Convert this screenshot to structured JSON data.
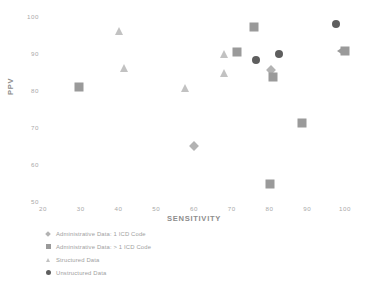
{
  "chart_data": {
    "type": "scatter",
    "title": "",
    "xlabel": "SENSITIVITY",
    "ylabel": "PPV",
    "xlim": [
      20,
      100
    ],
    "ylim": [
      50,
      100
    ],
    "xticks": [
      "20",
      "30",
      "40",
      "50",
      "60",
      "70",
      "80",
      "90",
      "100"
    ],
    "xtick_values": [
      20,
      30,
      40,
      50,
      60,
      70,
      80,
      90,
      100
    ],
    "yticks": [
      "50",
      "60",
      "70",
      "80",
      "90",
      "100"
    ],
    "ytick_values": [
      50,
      60,
      70,
      80,
      90,
      100
    ],
    "grid": false,
    "legend_position": "below-left",
    "colors": {
      "administrative_1_icd": "#b3b3b3",
      "administrative_gt1_icd": "#9a9a9a",
      "structured": "#c2c2c2",
      "unstructured": "#5e5e5e",
      "axis_text": "#a9a9a9",
      "axis_title": "#8d8d8d",
      "legend_text": "#a0a0a0",
      "background": "#ffffff"
    },
    "series": [
      {
        "name": "Administrative Data: 1 ICD Code",
        "marker": "diamond",
        "color": "#b3b3b3",
        "points": [
          {
            "x": 60.0,
            "y": 65.0
          },
          {
            "x": 80.5,
            "y": 85.3
          }
        ]
      },
      {
        "name": "Administrative Data: > 1 ICD Code",
        "marker": "square",
        "color": "#9a9a9a",
        "points": [
          {
            "x": 29.5,
            "y": 80.8
          },
          {
            "x": 71.5,
            "y": 90.3
          },
          {
            "x": 76.0,
            "y": 97.0
          },
          {
            "x": 81.0,
            "y": 83.5
          },
          {
            "x": 88.5,
            "y": 71.0
          },
          {
            "x": 80.0,
            "y": 54.5
          },
          {
            "x": 100.0,
            "y": 90.5
          }
        ]
      },
      {
        "name": "Structured Data",
        "marker": "triangle",
        "color": "#c2c2c2",
        "points": [
          {
            "x": 40.0,
            "y": 96.0
          },
          {
            "x": 41.5,
            "y": 86.0
          },
          {
            "x": 57.5,
            "y": 80.5
          },
          {
            "x": 68.0,
            "y": 89.8
          },
          {
            "x": 68.0,
            "y": 84.5
          }
        ]
      },
      {
        "name": "Unstructured Data",
        "marker": "circle",
        "color": "#5e5e5e",
        "points": [
          {
            "x": 76.5,
            "y": 88.0
          },
          {
            "x": 82.5,
            "y": 89.8
          },
          {
            "x": 97.5,
            "y": 97.8
          }
        ]
      }
    ],
    "annotations": [
      {
        "type": "left-arrow",
        "x": 98.6,
        "y": 90.5,
        "color": "#9a9a9a"
      }
    ]
  },
  "legend": {
    "items": [
      {
        "label": "Administrative Data: 1 ICD Code",
        "marker": "diamond",
        "color": "#b3b3b3"
      },
      {
        "label": "Administrative Data: > 1 ICD Code",
        "marker": "square",
        "color": "#9a9a9a"
      },
      {
        "label": "Structured Data",
        "marker": "triangle",
        "color": "#c2c2c2"
      },
      {
        "label": "Unstructured Data",
        "marker": "circle",
        "color": "#5e5e5e"
      }
    ]
  }
}
